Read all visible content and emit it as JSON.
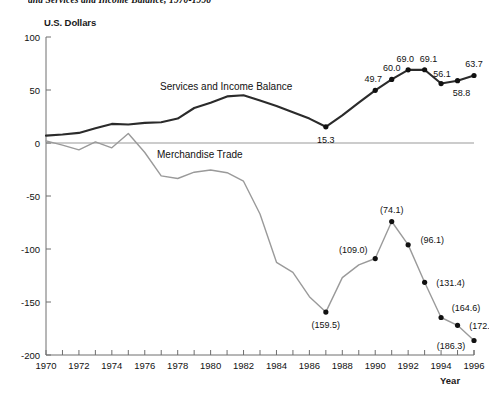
{
  "figure": {
    "title": "and Services and Income Balance, 1970-1996",
    "y_axis_unit_label": "U.S. Dollars",
    "x_axis_label": "Year"
  },
  "chart_data": {
    "type": "line",
    "title": "and Services and Income Balance, 1970-1996",
    "xlabel": "Year",
    "ylabel": "U.S. Dollars",
    "xlim": [
      1970,
      1996
    ],
    "ylim": [
      -200,
      100
    ],
    "ytick_labels": [
      "100",
      "50",
      "0",
      "-50",
      "-100",
      "-150",
      "-200"
    ],
    "ytick_values": [
      100,
      50,
      0,
      -50,
      -100,
      -150,
      -200
    ],
    "xtick_labels": [
      "1970",
      "1972",
      "1974",
      "1976",
      "1978",
      "1980",
      "1982",
      "1984",
      "1986",
      "1988",
      "1990",
      "1992",
      "1994",
      "1996"
    ],
    "xtick_values": [
      1970,
      1972,
      1974,
      1976,
      1978,
      1980,
      1982,
      1984,
      1986,
      1988,
      1990,
      1992,
      1994,
      1996
    ],
    "grid": false,
    "legend_position": "inline-annotation",
    "series": [
      {
        "name": "Services and Income Balance",
        "color": "#2b2b2b",
        "annotation_label": "Services and Income Balance",
        "x": [
          1970,
          1971,
          1972,
          1973,
          1974,
          1975,
          1976,
          1977,
          1978,
          1979,
          1980,
          1981,
          1982,
          1983,
          1984,
          1985,
          1986,
          1987,
          1988,
          1989,
          1990,
          1991,
          1992,
          1993,
          1994,
          1995,
          1996
        ],
        "values": [
          7.0,
          8.0,
          9.5,
          14.0,
          18.0,
          17.5,
          19.0,
          19.5,
          23.0,
          33.0,
          38.0,
          44.0,
          45.0,
          40.0,
          35.0,
          29.0,
          23.0,
          15.3,
          26.0,
          38.0,
          49.7,
          60.0,
          69.0,
          69.1,
          56.1,
          58.8,
          63.7
        ],
        "labeled_points": [
          {
            "year": 1987,
            "value": 15.3,
            "label": "15.3"
          },
          {
            "year": 1990,
            "value": 49.7,
            "label": "49.7"
          },
          {
            "year": 1991,
            "value": 60.0,
            "label": "60.0"
          },
          {
            "year": 1992,
            "value": 69.0,
            "label": "69.0"
          },
          {
            "year": 1993,
            "value": 69.1,
            "label": "69.1"
          },
          {
            "year": 1994,
            "value": 56.1,
            "label": "56.1"
          },
          {
            "year": 1995,
            "value": 58.8,
            "label": "58.8"
          },
          {
            "year": 1996,
            "value": 63.7,
            "label": "63.7"
          }
        ]
      },
      {
        "name": "Merchandise Trade",
        "color": "#9a9a9a",
        "annotation_label": "Merchandise Trade",
        "x": [
          1970,
          1971,
          1972,
          1973,
          1974,
          1975,
          1976,
          1977,
          1978,
          1979,
          1980,
          1981,
          1982,
          1983,
          1984,
          1985,
          1986,
          1987,
          1988,
          1989,
          1990,
          1991,
          1992,
          1993,
          1994,
          1995,
          1996
        ],
        "values": [
          2.0,
          -2.0,
          -6.5,
          1.0,
          -4.5,
          9.0,
          -9.0,
          -31.0,
          -33.5,
          -27.5,
          -25.5,
          -28.0,
          -36.0,
          -67.0,
          -112.5,
          -122.0,
          -145.0,
          -159.5,
          -127.0,
          -115.0,
          -109.0,
          -74.1,
          -96.1,
          -131.4,
          -164.6,
          -172.0,
          -186.3
        ],
        "labeled_points": [
          {
            "year": 1987,
            "value": -159.5,
            "label": "(159.5)"
          },
          {
            "year": 1990,
            "value": -109.0,
            "label": "(109.0)"
          },
          {
            "year": 1991,
            "value": -74.1,
            "label": "(74.1)"
          },
          {
            "year": 1992,
            "value": -96.1,
            "label": "(96.1)"
          },
          {
            "year": 1993,
            "value": -131.4,
            "label": "(131.4)"
          },
          {
            "year": 1994,
            "value": -164.6,
            "label": "(164.6)"
          },
          {
            "year": 1995,
            "value": -172.0,
            "label": "(172.0)"
          },
          {
            "year": 1996,
            "value": -186.3,
            "label": "(186.3)"
          }
        ]
      }
    ]
  }
}
